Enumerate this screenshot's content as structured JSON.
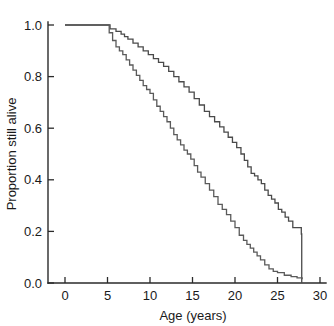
{
  "chart_data": {
    "type": "line",
    "title": "",
    "xlabel": "Age (years)",
    "ylabel": "Proportion still alive",
    "xlim": [
      0,
      30
    ],
    "ylim": [
      0,
      1.0
    ],
    "xticks": [
      "0",
      "5",
      "10",
      "15",
      "20",
      "25",
      "30"
    ],
    "xtick_values": [
      0,
      5,
      10,
      15,
      20,
      25,
      30
    ],
    "yticks": [
      "0.0",
      "0.2",
      "0.4",
      "0.6",
      "0.8",
      "1.0"
    ],
    "ytick_values": [
      0.0,
      0.2,
      0.4,
      0.6,
      0.8,
      1.0
    ],
    "grid": false,
    "legend": "none",
    "line_color": "#4a4a4a",
    "axis_color": "#2a2a2a",
    "background": "#ffffff",
    "step_style": "kaplan-meier",
    "series": [
      {
        "name": "upper-curve",
        "color": "#4a4a4a",
        "x": [
          0,
          5.0,
          5.3,
          6.0,
          6.6,
          7.0,
          7.4,
          8.0,
          8.6,
          9.2,
          9.8,
          10.4,
          11.0,
          11.6,
          12.2,
          12.8,
          13.4,
          14.0,
          14.6,
          15.2,
          15.8,
          16.4,
          17.0,
          17.6,
          18.2,
          18.7,
          19.2,
          19.7,
          20.2,
          20.7,
          21.1,
          21.5,
          21.9,
          22.3,
          22.7,
          23.1,
          23.5,
          23.9,
          24.3,
          24.7,
          25.1,
          25.5,
          25.9,
          26.3,
          26.8,
          27.8,
          27.85
        ],
        "y": [
          1.0,
          1.0,
          0.985,
          0.975,
          0.965,
          0.955,
          0.945,
          0.93,
          0.915,
          0.9,
          0.885,
          0.87,
          0.855,
          0.84,
          0.82,
          0.8,
          0.78,
          0.76,
          0.74,
          0.715,
          0.69,
          0.665,
          0.645,
          0.625,
          0.605,
          0.585,
          0.565,
          0.545,
          0.525,
          0.5,
          0.475,
          0.45,
          0.425,
          0.415,
          0.4,
          0.385,
          0.36,
          0.34,
          0.325,
          0.31,
          0.285,
          0.275,
          0.255,
          0.24,
          0.215,
          0.19,
          0.0
        ]
      },
      {
        "name": "lower-curve",
        "color": "#5a5a5a",
        "x": [
          0,
          5.0,
          5.2,
          5.6,
          6.0,
          6.4,
          6.8,
          7.2,
          7.6,
          8.0,
          8.4,
          8.8,
          9.2,
          9.6,
          10.0,
          10.4,
          10.8,
          11.2,
          11.6,
          12.0,
          12.4,
          12.8,
          13.2,
          13.6,
          14.0,
          14.4,
          14.8,
          15.2,
          15.6,
          16.0,
          16.5,
          17.0,
          17.5,
          18.0,
          18.5,
          19.0,
          19.5,
          20.0,
          20.5,
          21.0,
          21.4,
          21.8,
          22.2,
          22.6,
          23.0,
          23.5,
          24.0,
          24.5,
          25.0,
          25.8,
          26.6,
          27.3,
          27.9
        ],
        "y": [
          1.0,
          1.0,
          0.97,
          0.94,
          0.915,
          0.9,
          0.885,
          0.865,
          0.845,
          0.825,
          0.805,
          0.785,
          0.765,
          0.75,
          0.735,
          0.71,
          0.685,
          0.665,
          0.645,
          0.625,
          0.6,
          0.575,
          0.555,
          0.535,
          0.515,
          0.5,
          0.48,
          0.455,
          0.43,
          0.41,
          0.385,
          0.36,
          0.335,
          0.305,
          0.285,
          0.265,
          0.24,
          0.215,
          0.185,
          0.165,
          0.15,
          0.135,
          0.12,
          0.105,
          0.09,
          0.07,
          0.055,
          0.045,
          0.04,
          0.03,
          0.025,
          0.02,
          0.015
        ]
      }
    ]
  },
  "axes": {
    "y_label": "Proportion still alive",
    "x_label": "Age (years)"
  }
}
